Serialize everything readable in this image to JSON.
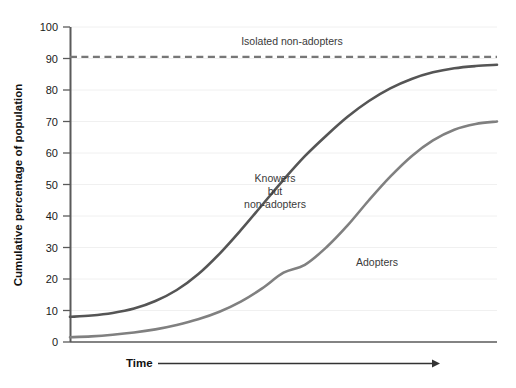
{
  "chart_data": {
    "type": "line",
    "title": "",
    "xlabel": "Time",
    "ylabel": "Cumulative percentage of population",
    "xlim": [
      0,
      100
    ],
    "ylim": [
      0,
      100
    ],
    "grid": true,
    "legend_position": "inline-annotations",
    "y_ticks": [
      0,
      10,
      20,
      30,
      40,
      50,
      60,
      70,
      80,
      90,
      100
    ],
    "y_tick_labels": [
      "0",
      "10",
      "20",
      "30",
      "40",
      "50",
      "60",
      "70",
      "80",
      "90",
      "100"
    ],
    "x_ticks": [],
    "x_tick_labels": [],
    "x_axis_arrow": true,
    "series": [
      {
        "name": "Isolated non-adopters",
        "style": "dashed",
        "color": "#777777",
        "constant_value": 90.5,
        "x": [
          0,
          100
        ],
        "values": [
          90.5,
          90.5
        ]
      },
      {
        "name": "Knowers but non-adopters",
        "style": "solid",
        "color": "#555555",
        "x": [
          0,
          5,
          10,
          15,
          20,
          25,
          30,
          35,
          40,
          45,
          50,
          55,
          60,
          65,
          70,
          75,
          80,
          85,
          90,
          95,
          100
        ],
        "values": [
          8,
          8.4,
          9.2,
          10.6,
          13,
          16.5,
          21.5,
          28,
          35.5,
          43.5,
          51.5,
          59,
          65.5,
          71.5,
          76.5,
          80.5,
          83.5,
          85.6,
          86.9,
          87.6,
          88
        ]
      },
      {
        "name": "Adopters",
        "style": "solid",
        "color": "#808080",
        "x": [
          0,
          5,
          10,
          15,
          20,
          25,
          30,
          35,
          40,
          45,
          50,
          55,
          60,
          65,
          70,
          75,
          80,
          85,
          90,
          95,
          100
        ],
        "values": [
          1.5,
          1.8,
          2.3,
          3.0,
          4.0,
          5.4,
          7.2,
          9.6,
          12.8,
          17.0,
          22.0,
          24.5,
          30.0,
          37.0,
          45.0,
          52.5,
          59.0,
          64.0,
          67.4,
          69.2,
          70.0
        ]
      }
    ],
    "annotations": [
      {
        "text": "Isolated non-adopters",
        "x_px": 292,
        "y_px": 45
      },
      {
        "text_lines": [
          "Knowers",
          "but",
          "non-adopters"
        ],
        "x_px": 275,
        "y_px": 182
      },
      {
        "text": "Adopters",
        "x_px": 377,
        "y_px": 266
      }
    ]
  },
  "labels": {
    "y_axis_title": "Cumulative percentage of population",
    "x_axis_title": "Time",
    "isolated": "Isolated non-adopters",
    "knowers_line1": "Knowers",
    "knowers_line2": "but",
    "knowers_line3": "non-adopters",
    "adopters": "Adopters"
  },
  "ticks": {
    "t0": "0",
    "t10": "10",
    "t20": "20",
    "t30": "30",
    "t40": "40",
    "t50": "50",
    "t60": "60",
    "t70": "70",
    "t80": "80",
    "t90": "90",
    "t100": "100"
  },
  "colors": {
    "knowers": "#555555",
    "adopters": "#808080",
    "isolated": "#777777",
    "axis": "#5a5a5a",
    "grid": "#f0f0f0",
    "text": "#1a1a1a",
    "background": "#ffffff"
  }
}
